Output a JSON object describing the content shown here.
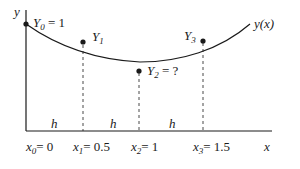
{
  "diagram": {
    "axes": {
      "x_label": "x",
      "y_label": "y"
    },
    "curve_label": "y(x)",
    "points": [
      {
        "name": "Y",
        "sub": "0",
        "suffix": " = 1"
      },
      {
        "name": "Y",
        "sub": "1",
        "suffix": ""
      },
      {
        "name": "Y",
        "sub": "2",
        "suffix": " = ?"
      },
      {
        "name": "Y",
        "sub": "3",
        "suffix": ""
      }
    ],
    "step_label": "h",
    "x_ticks": [
      {
        "name": "x",
        "sub": "0",
        "value": "= 0"
      },
      {
        "name": "x",
        "sub": "1",
        "value": "= 0.5"
      },
      {
        "name": "x",
        "sub": "2",
        "value": "= 1"
      },
      {
        "name": "x",
        "sub": "3",
        "value": "= 1.5"
      }
    ],
    "colors": {
      "ink": "#1a1a1a",
      "background": "#ffffff"
    }
  }
}
